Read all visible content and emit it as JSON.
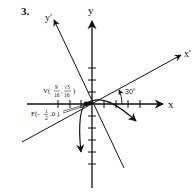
{
  "problem_number": "3.",
  "axes": {
    "x_label": "x",
    "y_label": "y",
    "x_prime_label": "x'",
    "y_prime_label": "y'"
  },
  "rotation": {
    "angle_label": "30°",
    "angle_degrees": 30
  },
  "vertex": {
    "prefix": "V(",
    "x_num": "9",
    "x_den": "16",
    "sep": ",",
    "y_num": "√3",
    "y_den": "16",
    "suffix": ")"
  },
  "focus": {
    "prefix": "F(-",
    "x_num": "1",
    "x_den": "2",
    "rest": ",0 )"
  },
  "colors": {
    "ink": "#111111",
    "background": "#ffffff"
  }
}
